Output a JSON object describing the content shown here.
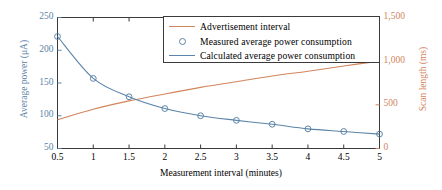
{
  "chart_data": {
    "type": "line",
    "title": "",
    "xlabel": "Measurement interval (minutes)",
    "ylabel": "Average power (μA)",
    "ylabel_right": "Scan length (ms)",
    "x": [
      0.5,
      1,
      1.5,
      2,
      2.5,
      3,
      3.5,
      4,
      4.5,
      5
    ],
    "xlim": [
      0.5,
      5
    ],
    "ylim": [
      50,
      250
    ],
    "ylim_right": [
      0,
      1500
    ],
    "grid": false,
    "legend_position": "top-center",
    "xticks": [
      "0.5",
      "1",
      "1.5",
      "2",
      "2.5",
      "3",
      "3.5",
      "4",
      "4.5",
      "5"
    ],
    "yticks_left": [
      "50",
      "100",
      "150",
      "200",
      "250"
    ],
    "yticks_right": [
      "0",
      "500",
      "1,000",
      "1,500"
    ],
    "series": [
      {
        "name": "Advertisement interval",
        "style": "line",
        "axis": "right",
        "color": "#d2845c",
        "values": [
          330,
          450,
          545,
          625,
          700,
          765,
          830,
          885,
          945,
          1000
        ]
      },
      {
        "name": "Measured average power consumption",
        "style": "marker",
        "axis": "left",
        "color": "#5b84a8",
        "values": [
          221,
          157,
          129,
          111,
          100,
          93,
          87,
          80,
          76,
          72
        ]
      },
      {
        "name": "Calculated average power consumption",
        "style": "line",
        "axis": "left",
        "color": "#5b84a8",
        "values": [
          221,
          157,
          129,
          111,
          100,
          93,
          87,
          80,
          76,
          72
        ]
      }
    ]
  },
  "axes": {
    "x_title": "Measurement interval (minutes)",
    "y_left_title": "Average power (μA)",
    "y_right_title": "Scan length (ms)",
    "x_ticks": [
      "0.5",
      "1",
      "1.5",
      "2",
      "2.5",
      "3",
      "3.5",
      "4",
      "4.5",
      "5"
    ],
    "y_left_ticks": [
      "250",
      "200",
      "150",
      "100",
      "50"
    ],
    "y_right_ticks": [
      "1,500",
      "1,000",
      "500",
      "0"
    ]
  },
  "legend": {
    "items": [
      {
        "label": "Advertisement interval",
        "key": "line-orange"
      },
      {
        "label": "Measured average power consumption",
        "key": "circle-marker"
      },
      {
        "label": "Calculated average power consumption",
        "key": "line-blue"
      }
    ]
  },
  "colors": {
    "advertisement": "#d2845c",
    "power": "#5b84a8",
    "axis": "#3a3a3a"
  }
}
